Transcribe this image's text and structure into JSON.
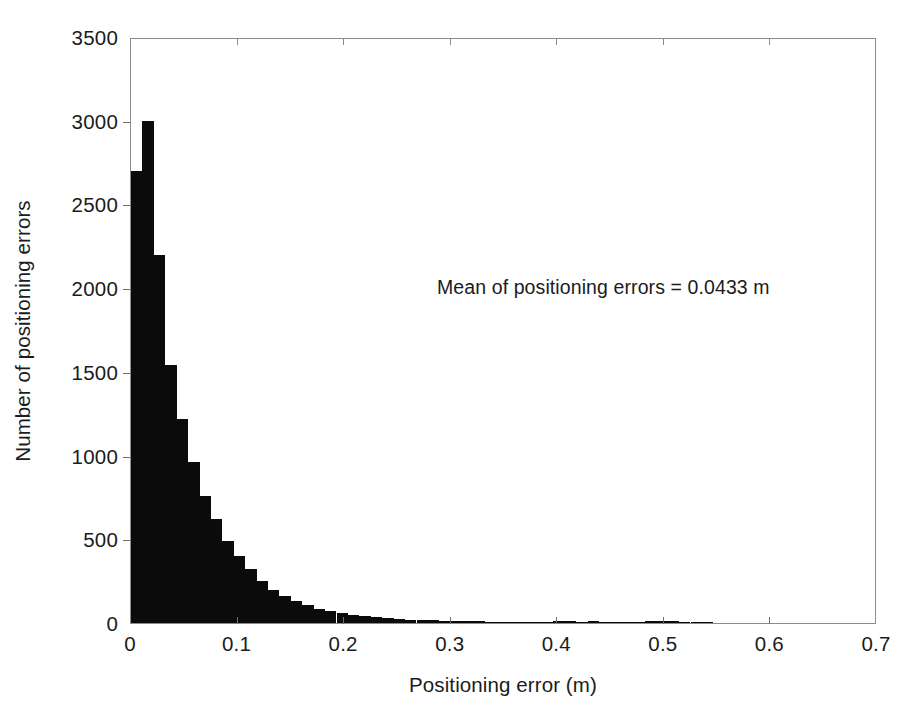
{
  "chart_data": {
    "type": "bar",
    "title": "",
    "subtitle": "",
    "xlabel": "Positioning error (m)",
    "ylabel": "Number of positioning errors",
    "xlim": [
      0,
      0.7
    ],
    "ylim": [
      0,
      3500
    ],
    "grid": false,
    "legend": null,
    "bar_color": "#0b0b0b",
    "bin_width": 0.0107,
    "xticks": [
      0,
      0.1,
      0.2,
      0.3,
      0.4,
      0.5,
      0.6,
      0.7
    ],
    "xtick_labels": [
      "0",
      "0.1",
      "0.2",
      "0.3",
      "0.4",
      "0.5",
      "0.6",
      "0.7"
    ],
    "yticks": [
      0,
      500,
      1000,
      1500,
      2000,
      2500,
      3000,
      3500
    ],
    "ytick_labels": [
      "0",
      "500",
      "1000",
      "1500",
      "2000",
      "2500",
      "3000",
      "3500"
    ],
    "annotations": [
      {
        "name": "mean-annotation",
        "text": "Mean of positioning errors = 0.0433 m",
        "x": 0.29,
        "y": 3050
      }
    ],
    "bin_edges": [
      0.0,
      0.0107,
      0.0214,
      0.0321,
      0.0429,
      0.0536,
      0.0643,
      0.075,
      0.0857,
      0.0964,
      0.1071,
      0.1179,
      0.1286,
      0.1393,
      0.15,
      0.1607,
      0.1714,
      0.1821,
      0.1929,
      0.2036,
      0.2143,
      0.225,
      0.2357,
      0.2464,
      0.2571,
      0.2679,
      0.2786,
      0.2893,
      0.3,
      0.3107,
      0.3214,
      0.3321,
      0.3429,
      0.3536,
      0.3643,
      0.375,
      0.3857,
      0.3964,
      0.4071,
      0.4179,
      0.4286,
      0.4393,
      0.45,
      0.4607,
      0.4714,
      0.4821,
      0.4929,
      0.5036,
      0.5143,
      0.525,
      0.5357,
      0.5464
    ],
    "x": [
      0.0054,
      0.0161,
      0.0268,
      0.0375,
      0.0482,
      0.0589,
      0.0696,
      0.0804,
      0.0911,
      0.1018,
      0.1125,
      0.1232,
      0.1339,
      0.1446,
      0.1554,
      0.1661,
      0.1768,
      0.1875,
      0.1982,
      0.2089,
      0.2196,
      0.2304,
      0.2411,
      0.2518,
      0.2625,
      0.2732,
      0.2839,
      0.2946,
      0.3054,
      0.3161,
      0.3268,
      0.3375,
      0.3482,
      0.3589,
      0.3696,
      0.3804,
      0.3911,
      0.4018,
      0.4125,
      0.4232,
      0.4339,
      0.4446,
      0.4554,
      0.4661,
      0.4768,
      0.4875,
      0.4982,
      0.5089,
      0.5196,
      0.5304,
      0.5411
    ],
    "values": [
      2700,
      3000,
      2200,
      1540,
      1220,
      960,
      760,
      620,
      490,
      400,
      320,
      250,
      200,
      160,
      130,
      105,
      85,
      72,
      60,
      48,
      40,
      33,
      28,
      24,
      20,
      18,
      16,
      14,
      12,
      11,
      10,
      9,
      8,
      7,
      7,
      6,
      6,
      12,
      10,
      6,
      10,
      5,
      3,
      3,
      3,
      12,
      12,
      10,
      3,
      9,
      9
    ],
    "categories": [
      "0.005",
      "0.016",
      "0.027",
      "0.038",
      "0.048",
      "0.059",
      "0.070",
      "0.080",
      "0.091",
      "0.102",
      "0.113",
      "0.123",
      "0.134",
      "0.145",
      "0.155",
      "0.166",
      "0.177",
      "0.188",
      "0.198",
      "0.209",
      "0.220",
      "0.230",
      "0.241",
      "0.252",
      "0.263",
      "0.273",
      "0.284",
      "0.295",
      "0.305",
      "0.316",
      "0.327",
      "0.338",
      "0.348",
      "0.359",
      "0.370",
      "0.380",
      "0.391",
      "0.402",
      "0.413",
      "0.423",
      "0.434",
      "0.445",
      "0.455",
      "0.466",
      "0.477",
      "0.488",
      "0.498",
      "0.509",
      "0.520",
      "0.530",
      "0.541"
    ]
  }
}
